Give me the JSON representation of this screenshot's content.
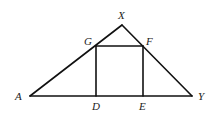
{
  "diagram": {
    "type": "geometry",
    "stroke_color": "#111111",
    "label_color": "#222222",
    "vertices": {
      "A": {
        "label": "A",
        "x": 30,
        "y": 96
      },
      "X": {
        "label": "X",
        "x": 122,
        "y": 25
      },
      "Y": {
        "label": "Y",
        "x": 192,
        "y": 96
      },
      "G": {
        "label": "G",
        "x": 96,
        "y": 46
      },
      "F": {
        "label": "F",
        "x": 143,
        "y": 46
      },
      "D": {
        "label": "D",
        "x": 96,
        "y": 96
      },
      "E": {
        "label": "E",
        "x": 143,
        "y": 96
      }
    },
    "segments": [
      [
        "A",
        "X"
      ],
      [
        "X",
        "Y"
      ],
      [
        "A",
        "Y"
      ],
      [
        "G",
        "F"
      ],
      [
        "G",
        "D"
      ],
      [
        "F",
        "E"
      ]
    ],
    "labels": {
      "A": "A",
      "X": "X",
      "Y": "Y",
      "G": "G",
      "F": "F",
      "D": "D",
      "E": "E"
    }
  }
}
